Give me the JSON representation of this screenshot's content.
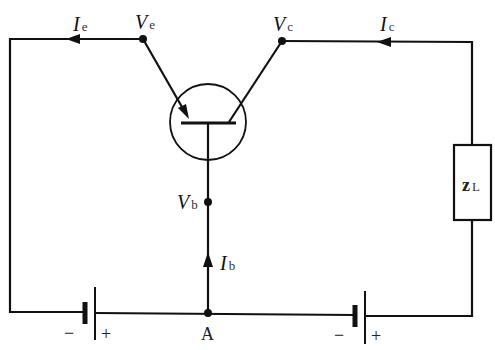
{
  "diagram": {
    "type": "transistor-circuit",
    "labels": {
      "Ie": {
        "main": "I",
        "sub": "e"
      },
      "Ve": {
        "main": "V",
        "sub": "e"
      },
      "Vc": {
        "main": "V",
        "sub": "c"
      },
      "Ic": {
        "main": "I",
        "sub": "c"
      },
      "Vb": {
        "main": "V",
        "sub": "b"
      },
      "Ib": {
        "main": "I",
        "sub": "b"
      },
      "ZL": {
        "main": "z",
        "sub": "L"
      },
      "node_A": "A",
      "battery_left": {
        "neg": "−",
        "pos": "+"
      },
      "battery_right": {
        "neg": "−",
        "pos": "+"
      }
    },
    "colors": {
      "line": "#111111",
      "background": "#ffffff"
    }
  }
}
